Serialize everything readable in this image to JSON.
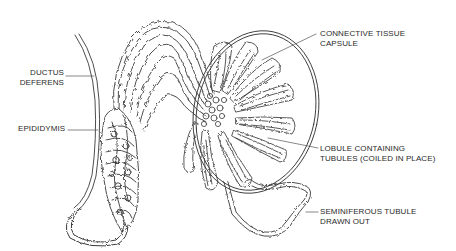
{
  "diagram": {
    "type": "anatomical-illustration",
    "colors": {
      "line": "#3a3a3a",
      "background": "#ffffff",
      "text": "#2a2a2a"
    },
    "labels": {
      "ductus_deferens": {
        "line1": "DUCTUS",
        "line2": "DEFERENS"
      },
      "epididymis": {
        "line1": "EPIDIDYMIS"
      },
      "capsule": {
        "line1": "CONNECTIVE TISSUE",
        "line2": "CAPSULE"
      },
      "lobule": {
        "line1": "LOBULE CONTAINING",
        "line2": "TUBULES (COILED IN PLACE)"
      },
      "tubule": {
        "line1": "SEMINIFEROUS TUBULE",
        "line2": "DRAWN OUT"
      }
    }
  }
}
